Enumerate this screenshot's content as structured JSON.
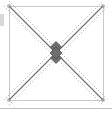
{
  "canvas": {
    "width": 112,
    "height": 113,
    "background_color": "#ffffff",
    "description": "square drawing frame with crossing diagonal construction lines"
  },
  "frame": {
    "name": "bounding-square",
    "x": 9,
    "y": 6,
    "width": 94,
    "height": 94,
    "stroke_color": "#c9c9c9",
    "stroke_width": 1,
    "fill": "none"
  },
  "diagonals": [
    {
      "name": "diagonal-top-left-to-bottom-right",
      "x1": 9,
      "y1": 6,
      "x2": 103,
      "y2": 100,
      "stroke_color": "#707070",
      "stroke_width": 1.1,
      "style": "solid"
    },
    {
      "name": "diagonal-bottom-left-to-top-right",
      "x1": 9,
      "y1": 100,
      "x2": 103,
      "y2": 6,
      "stroke_color": "#707070",
      "stroke_width": 1.1,
      "style": "solid"
    }
  ],
  "guide_lines": [
    {
      "name": "guide-upper-of-descending-diagonal",
      "x1": 9,
      "y1": 1,
      "x2": 108,
      "y2": 100,
      "stroke_color": "#9a9a9a",
      "stroke_width": 0.9,
      "style": "dotted",
      "dash": "1 2"
    },
    {
      "name": "guide-lower-of-descending-diagonal",
      "x1": 4,
      "y1": 6,
      "x2": 103,
      "y2": 105,
      "stroke_color": "#9a9a9a",
      "stroke_width": 0.9,
      "style": "dotted",
      "dash": "1 2"
    },
    {
      "name": "guide-upper-of-ascending-diagonal",
      "x1": 4,
      "y1": 100,
      "x2": 103,
      "y2": 1,
      "stroke_color": "#9a9a9a",
      "stroke_width": 0.9,
      "style": "dotted",
      "dash": "1 2"
    },
    {
      "name": "guide-lower-of-ascending-diagonal",
      "x1": 9,
      "y1": 105,
      "x2": 108,
      "y2": 6,
      "stroke_color": "#9a9a9a",
      "stroke_width": 0.9,
      "style": "dotted",
      "dash": "1 2"
    }
  ],
  "center_handles": {
    "name": "center-intersection-handles",
    "center_x": 56,
    "center_y": 53,
    "fill_color": "#6e6e6e",
    "stroke_color": "#4a4a4a",
    "markers": [
      {
        "name": "handle-upper",
        "cx": 56,
        "cy": 47,
        "size": 5.5
      },
      {
        "name": "handle-lower",
        "cx": 56,
        "cy": 58,
        "size": 5.5
      },
      {
        "name": "handle-center",
        "cx": 56,
        "cy": 53,
        "size": 6.0
      }
    ]
  },
  "corner_markers": [
    {
      "name": "corner-marker-top-left",
      "cx": 9,
      "cy": 6,
      "size": 2.2,
      "color": "#8a8a8a"
    },
    {
      "name": "corner-marker-top-right",
      "cx": 103,
      "cy": 6,
      "size": 2.2,
      "color": "#8a8a8a"
    },
    {
      "name": "corner-marker-bottom-left",
      "cx": 9,
      "cy": 100,
      "size": 2.2,
      "color": "#8a8a8a"
    },
    {
      "name": "corner-marker-bottom-right",
      "cx": 103,
      "cy": 100,
      "size": 2.2,
      "color": "#8a8a8a"
    }
  ],
  "edge_tab": {
    "name": "left-edge-tab",
    "x": 0,
    "y": 14,
    "width": 4,
    "height": 12,
    "fill_color": "#d8d8d8"
  },
  "bottom_divider": {
    "name": "bottom-divider-line",
    "x1": 0,
    "y1": 108,
    "x2": 112,
    "y2": 108,
    "stroke_color": "#bfbfbf",
    "stroke_width": 1
  }
}
